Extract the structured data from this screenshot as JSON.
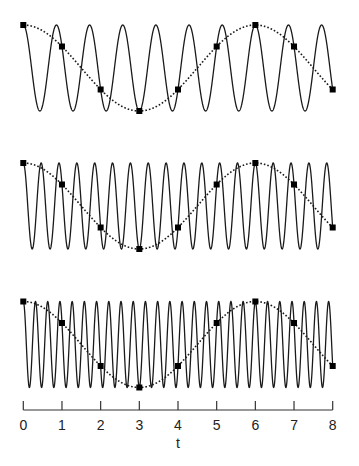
{
  "chart_data": {
    "type": "line",
    "title": "",
    "xlabel": "t",
    "ylabel": "",
    "xlim": [
      0,
      8
    ],
    "ylim": [
      -1,
      1
    ],
    "grid": false,
    "legend": null,
    "x_ticks": [
      0,
      1,
      2,
      3,
      4,
      5,
      6,
      7,
      8
    ],
    "x_tick_labels": [
      "0",
      "1",
      "2",
      "3",
      "4",
      "5",
      "6",
      "7",
      "8"
    ],
    "panels": [
      {
        "name": "panel-1",
        "continuous_signal": {
          "function": "cos(2*pi*f*t)",
          "frequency": 1.1667,
          "style": "solid"
        },
        "alias_signal": {
          "function": "cos(2*pi*t/6)",
          "frequency": 0.1667,
          "style": "dotted"
        },
        "samples": {
          "t": [
            0,
            1,
            2,
            3,
            4,
            5,
            6,
            7,
            8
          ],
          "values": [
            1,
            0.5,
            -0.5,
            -1,
            -0.5,
            0.5,
            1,
            0.5,
            -0.5
          ],
          "marker": "square"
        }
      },
      {
        "name": "panel-2",
        "continuous_signal": {
          "function": "cos(2*pi*f*t)",
          "frequency": 2.1667,
          "style": "solid"
        },
        "alias_signal": {
          "function": "cos(2*pi*t/6)",
          "frequency": 0.1667,
          "style": "dotted"
        },
        "samples": {
          "t": [
            0,
            1,
            2,
            3,
            4,
            5,
            6,
            7,
            8
          ],
          "values": [
            1,
            0.5,
            -0.5,
            -1,
            -0.5,
            0.5,
            1,
            0.5,
            -0.5
          ],
          "marker": "square"
        }
      },
      {
        "name": "panel-3",
        "continuous_signal": {
          "function": "cos(2*pi*f*t)",
          "frequency": 3.1667,
          "style": "solid"
        },
        "alias_signal": {
          "function": "cos(2*pi*t/6)",
          "frequency": 0.1667,
          "style": "dotted"
        },
        "samples": {
          "t": [
            0,
            1,
            2,
            3,
            4,
            5,
            6,
            7,
            8
          ],
          "values": [
            1,
            0.5,
            -0.5,
            -1,
            -0.5,
            0.5,
            1,
            0.5,
            -0.5
          ],
          "marker": "square"
        }
      }
    ],
    "colors": {
      "signal": "#1a1a1a",
      "alias": "#1a1a1a",
      "marker": "#000000",
      "axis": "#333333"
    }
  }
}
